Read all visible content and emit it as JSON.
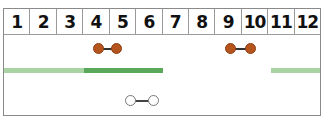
{
  "header": {
    "columns": [
      "1",
      "2",
      "3",
      "4",
      "5",
      "6",
      "7",
      "8",
      "9",
      "10",
      "11",
      "12"
    ]
  },
  "colors": {
    "filled_dot": "#b5541d",
    "hollow_dot": "#ffffff",
    "bar_light": "#a9d3a3",
    "bar_dark": "#5aa95a",
    "connector": "#333333",
    "border": "#8a8a8a"
  },
  "rows": {
    "dumbbells_filled": [
      {
        "from": 4,
        "to": 5
      },
      {
        "from": 9,
        "to": 10
      }
    ],
    "bars": [
      {
        "from": 1,
        "to": 3,
        "shade": "light"
      },
      {
        "from": 4,
        "to": 6,
        "shade": "dark"
      },
      {
        "from": 11,
        "to": 12,
        "shade": "light"
      }
    ],
    "dumbbells_hollow": [
      {
        "from": 5.5,
        "to": 6.5
      }
    ]
  }
}
